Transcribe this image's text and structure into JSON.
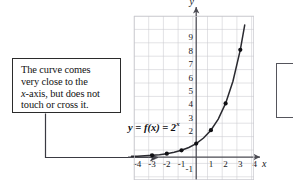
{
  "figure": {
    "name": "exponential-function-graph-with-callout",
    "background_color": "#ffffff"
  },
  "callout": {
    "name": "annotation-callout",
    "text": "The curve comes\nvery close to the\nx-axis, but does not\ntouch or cross it.",
    "italic_token": "x",
    "border_color": "#2b2b2b",
    "leader_style": "elbow-arrow",
    "leader_target": "curve near x = -4"
  },
  "function_label": {
    "name": "function-equation-label",
    "text": "y = f(x) = 2",
    "exponent": "x",
    "full": "y = f(x) = 2^x"
  },
  "chart_data": {
    "type": "line",
    "title": "",
    "subtitle": "",
    "xlabel": "x",
    "ylabel": "y",
    "function": "y = f(x) = 2^x",
    "grid": true,
    "legend_position": "none",
    "xlim": [
      -4.6,
      4.6
    ],
    "ylim": [
      -1.6,
      9.8
    ],
    "xticks": [
      -4,
      -3,
      -2,
      -1,
      1,
      2,
      3,
      4
    ],
    "xtick_labels": [
      "-4",
      "-3",
      "-2",
      "-1",
      "1",
      "2",
      "3",
      "4"
    ],
    "yticks": [
      -1,
      2,
      3,
      4,
      5,
      6,
      7,
      8,
      9
    ],
    "ytick_labels": [
      "-1",
      "2",
      "3",
      "4",
      "5",
      "6",
      "7",
      "8",
      "9"
    ],
    "series": [
      {
        "name": "f(x) = 2^x",
        "type": "line",
        "color": "#2a2a30",
        "x": [
          -4.4,
          -4,
          -3.5,
          -3,
          -2.5,
          -2,
          -1.5,
          -1,
          -0.5,
          0,
          0.5,
          1,
          1.5,
          2,
          2.5,
          3,
          3.3
        ],
        "values": [
          0.047,
          0.0625,
          0.088,
          0.125,
          0.177,
          0.25,
          0.354,
          0.5,
          0.707,
          1,
          1.414,
          2,
          2.828,
          4,
          5.657,
          8,
          9.85
        ]
      }
    ],
    "markers": {
      "name": "plotted-points",
      "color": "#101014",
      "x": [
        -3,
        -2,
        -1,
        0,
        1,
        2,
        3
      ],
      "values": [
        0.125,
        0.25,
        0.5,
        1,
        2,
        4,
        8
      ],
      "labels": [
        "(-3, 0.125)",
        "(-2, 0.25)",
        "(-1, 0.5)",
        "(0, 1)",
        "(1, 2)",
        "(2, 4)",
        "(3, 8)"
      ]
    },
    "axis_arrows": {
      "x_positive": true,
      "y_positive": true
    },
    "colors": {
      "grid": "#c9c9cf",
      "axis": "#4a4a52",
      "curve": "#2a2a30",
      "point": "#101014",
      "text": "#16161a"
    }
  }
}
